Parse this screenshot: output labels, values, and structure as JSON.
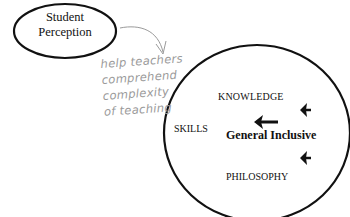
{
  "diagram": {
    "small_node": {
      "line1": "Student",
      "line2": "Perception"
    },
    "annotation": {
      "lines": [
        "help teachers",
        "comprehend",
        "complexity",
        "of teaching"
      ],
      "color": "#9a9a9a"
    },
    "big_node": {
      "knowledge": "KNOWLEDGE",
      "skills": "SKILLS",
      "center": "General Inclusive",
      "philosophy": "PHILOSOPHY"
    },
    "colors": {
      "stroke": "#111111",
      "background": "#ffffff"
    }
  }
}
